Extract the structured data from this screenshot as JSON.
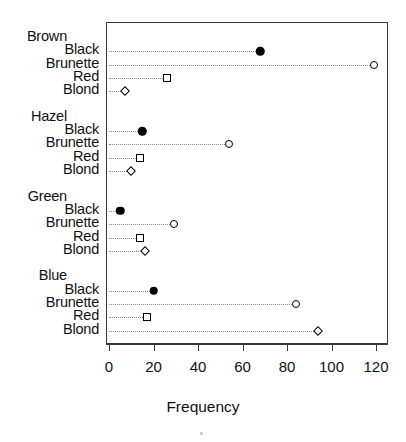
{
  "chart_data": {
    "type": "scatter",
    "chart_style": "cleveland-dot-plot",
    "title": "",
    "xlabel": "Frequency",
    "ylabel": "",
    "xlim": [
      0,
      126.6
    ],
    "xticks": [
      0,
      20,
      40,
      60,
      80,
      100,
      120
    ],
    "xtick_labels": [
      "0",
      "20",
      "40",
      "60",
      "80",
      "100",
      "120"
    ],
    "grid": false,
    "legend": "none",
    "groups": [
      {
        "label": "Brown",
        "items": [
          {
            "label": "Black",
            "value": 68,
            "marker": "filled-circle"
          },
          {
            "label": "Brunette",
            "value": 119,
            "marker": "open-circle"
          },
          {
            "label": "Red",
            "value": 26,
            "marker": "square"
          },
          {
            "label": "Blond",
            "value": 7,
            "marker": "diamond"
          }
        ]
      },
      {
        "label": "Hazel",
        "items": [
          {
            "label": "Black",
            "value": 15,
            "marker": "filled-circle"
          },
          {
            "label": "Brunette",
            "value": 54,
            "marker": "open-circle"
          },
          {
            "label": "Red",
            "value": 14,
            "marker": "square"
          },
          {
            "label": "Blond",
            "value": 10,
            "marker": "diamond"
          }
        ]
      },
      {
        "label": "Green",
        "items": [
          {
            "label": "Black",
            "value": 5,
            "marker": "filled-circle"
          },
          {
            "label": "Brunette",
            "value": 29,
            "marker": "open-circle"
          },
          {
            "label": "Red",
            "value": 14,
            "marker": "square"
          },
          {
            "label": "Blond",
            "value": 16,
            "marker": "diamond"
          }
        ]
      },
      {
        "label": "Blue",
        "items": [
          {
            "label": "Black",
            "value": 20,
            "marker": "filled-circle"
          },
          {
            "label": "Brunette",
            "value": 84,
            "marker": "open-circle"
          },
          {
            "label": "Red",
            "value": 17,
            "marker": "square"
          },
          {
            "label": "Blond",
            "value": 94,
            "marker": "diamond"
          }
        ]
      }
    ],
    "colors": {
      "marker_stroke": "#000000",
      "marker_fill_black": "#000000",
      "marker_fill_open": "#ffffff",
      "leader_line": "#8a8a8a",
      "axis": "#3a3a3a",
      "text": "#111111",
      "background": "#ffffff"
    }
  },
  "axis": {
    "x_title": "Frequency"
  }
}
